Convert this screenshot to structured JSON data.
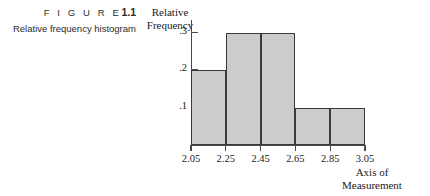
{
  "caption": {
    "figure_word": "F I G U R E",
    "figure_number": "1.1",
    "description": "Relative frequency histogram"
  },
  "chart_data": {
    "type": "bar",
    "title": "Relative frequency histogram",
    "xlabel": "Axis of Measurement",
    "ylabel": "Relative Frequency",
    "bin_edges": [
      2.05,
      2.25,
      2.45,
      2.65,
      2.85,
      3.05
    ],
    "categories": [
      "2.05-2.25",
      "2.25-2.45",
      "2.45-2.65",
      "2.65-2.85",
      "2.85-3.05"
    ],
    "values": [
      0.2,
      0.3,
      0.3,
      0.1,
      0.1
    ],
    "xticks": [
      "2.05",
      "2.25",
      "2.45",
      "2.65",
      "2.85",
      "3.05"
    ],
    "yticks": [
      ".1",
      ".2",
      ".3"
    ],
    "ytick_values": [
      0.1,
      0.2,
      0.3
    ],
    "xlim": [
      2.05,
      3.05
    ],
    "ylim": [
      0,
      0.33
    ],
    "grid": false,
    "legend": false,
    "bar_fill_color": "#cccccc",
    "bar_edge_color": "#3a3a3a",
    "axis_color": "#4a4a4a"
  },
  "axes": {
    "y_title_line1": "Relative",
    "y_title_line2": "Frequency",
    "x_title_line1": "Axis of",
    "x_title_line2": "Measurement"
  }
}
